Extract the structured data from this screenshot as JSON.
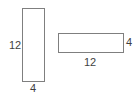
{
  "figure": {
    "background_color": "#ffffff",
    "stroke_color": "#7f7f7f",
    "text_color": "#3f3f3f",
    "shapes": [
      {
        "name": "portrait-rectangle",
        "orientation": "vertical",
        "width_label": "4",
        "height_label": "12"
      },
      {
        "name": "landscape-rectangle",
        "orientation": "horizontal",
        "width_label": "12",
        "height_label": "4"
      }
    ],
    "labels": {
      "portrait_height": "12",
      "portrait_width": "4",
      "landscape_height": "4",
      "landscape_width": "12"
    }
  }
}
